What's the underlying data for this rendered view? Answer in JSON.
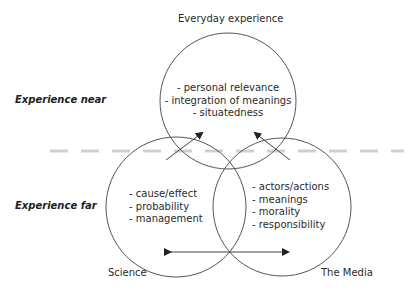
{
  "diagram": {
    "circles": {
      "top": {
        "label": "Everyday experience",
        "items": [
          "- personal relevance",
          "- integration of meanings",
          "- situatedness"
        ]
      },
      "left": {
        "label": "Science",
        "items": [
          "- cause/effect",
          "- probability",
          "- management"
        ]
      },
      "right": {
        "label": "The Media",
        "items": [
          "- actors/actions",
          "- meanings",
          "- morality",
          "- responsibility"
        ]
      }
    },
    "levels": {
      "near": "Experience near",
      "far": "Experience far"
    },
    "colors": {
      "stroke": "#555555",
      "divider": "#cccccc",
      "text": "#2a2a2a"
    }
  }
}
